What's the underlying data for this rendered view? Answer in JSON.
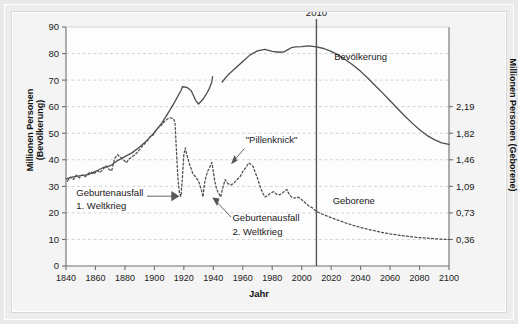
{
  "figure": {
    "xlabel": "Jahr",
    "ylabel_left": "Millionen Personen (Bevölkerung)",
    "ylabel_right": "Millionen Personen (Geborene)"
  },
  "annotations": {
    "marker_year": "2010",
    "series_population": "Bevölkerung",
    "series_births": "Geborene",
    "pillenknick": "\"Pillenknick\"",
    "wk1_line1": "Geburtenausfall",
    "wk1_line2": "1. Weltkrieg",
    "wk2_line1": "Geburtenausfall",
    "wk2_line2": "2. Weltkrieg"
  },
  "chart_data": {
    "type": "line",
    "title": "",
    "xlabel": "Jahr",
    "ylabel": "Millionen Personen (Bevölkerung)",
    "ylabel_secondary": "Millionen Personen (Geborene)",
    "xlim": [
      1840,
      2100
    ],
    "ylim": [
      0,
      90
    ],
    "ylim_secondary": [
      0,
      3.28
    ],
    "xticks": [
      1840,
      1860,
      1880,
      1900,
      1920,
      1940,
      1960,
      1980,
      2000,
      2020,
      2040,
      2060,
      2080,
      2100
    ],
    "yticks_left": [
      0,
      10,
      20,
      30,
      40,
      50,
      60,
      70,
      80,
      90
    ],
    "yticks_right_labels": [
      "0,36",
      "0,73",
      "1,09",
      "1,46",
      "1,82",
      "2,19"
    ],
    "yticks_right_at_left_values": [
      10,
      20,
      30,
      40,
      50,
      60
    ],
    "grid": true,
    "grid_style": "dashed-horizontal",
    "legend": "inline-labels",
    "vertical_marker": 2010,
    "series": [
      {
        "name": "Bevölkerung",
        "style": "solid",
        "axis": "left",
        "unit": "Millionen Personen",
        "points": [
          [
            1840,
            32.8
          ],
          [
            1845,
            33.6
          ],
          [
            1850,
            34.0
          ],
          [
            1855,
            34.4
          ],
          [
            1860,
            35.6
          ],
          [
            1865,
            37.0
          ],
          [
            1867,
            37.2
          ],
          [
            1870,
            37.8
          ],
          [
            1871,
            38.0
          ],
          [
            1875,
            39.7
          ],
          [
            1880,
            41.2
          ],
          [
            1885,
            42.7
          ],
          [
            1890,
            44.8
          ],
          [
            1895,
            47.3
          ],
          [
            1900,
            50.3
          ],
          [
            1905,
            53.8
          ],
          [
            1910,
            58.2
          ],
          [
            1914,
            62.0
          ],
          [
            1918,
            66.0
          ],
          [
            1919,
            67.5
          ],
          [
            1922,
            67.3
          ],
          [
            1925,
            66.0
          ],
          [
            1928,
            62.4
          ],
          [
            1930,
            61.0
          ],
          [
            1933,
            62.8
          ],
          [
            1935,
            64.5
          ],
          [
            1937,
            66.5
          ],
          [
            1939,
            69.3
          ],
          [
            1939.5,
            71.3
          ],
          [
            1946,
            69.3
          ],
          [
            1950,
            72.0
          ],
          [
            1955,
            74.5
          ],
          [
            1960,
            77.0
          ],
          [
            1965,
            79.5
          ],
          [
            1970,
            81.0
          ],
          [
            1975,
            81.6
          ],
          [
            1980,
            80.8
          ],
          [
            1985,
            80.5
          ],
          [
            1988,
            80.6
          ],
          [
            1990,
            81.3
          ],
          [
            1993,
            82.2
          ],
          [
            1996,
            82.5
          ],
          [
            2000,
            82.6
          ],
          [
            2005,
            82.9
          ],
          [
            2010,
            82.5
          ],
          [
            2015,
            81.9
          ],
          [
            2020,
            80.8
          ],
          [
            2025,
            79.4
          ],
          [
            2030,
            77.6
          ],
          [
            2035,
            75.6
          ],
          [
            2040,
            73.3
          ],
          [
            2045,
            70.7
          ],
          [
            2050,
            67.9
          ],
          [
            2055,
            65.1
          ],
          [
            2060,
            62.2
          ],
          [
            2065,
            59.3
          ],
          [
            2070,
            56.5
          ],
          [
            2075,
            53.8
          ],
          [
            2080,
            51.3
          ],
          [
            2085,
            49.2
          ],
          [
            2090,
            47.6
          ],
          [
            2095,
            46.4
          ],
          [
            2100,
            45.8
          ]
        ]
      },
      {
        "name": "Geborene",
        "style": "dotted",
        "axis": "right",
        "unit": "Millionen Geborene",
        "points_in_left_scale": [
          [
            1841,
            32.0
          ],
          [
            1843,
            33.5
          ],
          [
            1845,
            32.6
          ],
          [
            1847,
            34.2
          ],
          [
            1849,
            33.2
          ],
          [
            1851,
            34.3
          ],
          [
            1853,
            33.6
          ],
          [
            1855,
            34.8
          ],
          [
            1857,
            35.4
          ],
          [
            1859,
            34.6
          ],
          [
            1861,
            36.0
          ],
          [
            1863,
            35.2
          ],
          [
            1865,
            36.3
          ],
          [
            1867,
            37.8
          ],
          [
            1869,
            36.5
          ],
          [
            1871,
            35.8
          ],
          [
            1873,
            40.5
          ],
          [
            1875,
            41.9
          ],
          [
            1877,
            41.0
          ],
          [
            1879,
            40.0
          ],
          [
            1881,
            38.9
          ],
          [
            1883,
            40.4
          ],
          [
            1885,
            41.2
          ],
          [
            1887,
            42.0
          ],
          [
            1889,
            43.1
          ],
          [
            1891,
            44.6
          ],
          [
            1893,
            45.8
          ],
          [
            1895,
            47.0
          ],
          [
            1897,
            48.6
          ],
          [
            1899,
            49.2
          ],
          [
            1901,
            51.0
          ],
          [
            1903,
            52.3
          ],
          [
            1905,
            53.2
          ],
          [
            1907,
            54.5
          ],
          [
            1909,
            55.4
          ],
          [
            1911,
            55.8
          ],
          [
            1913,
            55.5
          ],
          [
            1914,
            54.0
          ],
          [
            1915,
            43.0
          ],
          [
            1916,
            33.0
          ],
          [
            1917,
            27.5
          ],
          [
            1918,
            26.2
          ],
          [
            1919,
            33.0
          ],
          [
            1920,
            42.0
          ],
          [
            1921,
            44.5
          ],
          [
            1922,
            42.0
          ],
          [
            1924,
            38.0
          ],
          [
            1926,
            35.0
          ],
          [
            1928,
            33.5
          ],
          [
            1930,
            32.0
          ],
          [
            1932,
            28.5
          ],
          [
            1933,
            26.0
          ],
          [
            1934,
            31.0
          ],
          [
            1935,
            33.5
          ],
          [
            1936,
            35.5
          ],
          [
            1937,
            36.5
          ],
          [
            1939,
            39.0
          ],
          [
            1940,
            35.5
          ],
          [
            1941,
            32.0
          ],
          [
            1942,
            29.5
          ],
          [
            1943,
            28.0
          ],
          [
            1944,
            27.0
          ],
          [
            1945,
            26.0
          ],
          [
            1946,
            28.5
          ],
          [
            1948,
            32.5
          ],
          [
            1950,
            31.0
          ],
          [
            1952,
            30.5
          ],
          [
            1954,
            31.2
          ],
          [
            1956,
            32.5
          ],
          [
            1958,
            33.5
          ],
          [
            1960,
            35.5
          ],
          [
            1962,
            37.0
          ],
          [
            1964,
            38.8
          ],
          [
            1965,
            38.5
          ],
          [
            1966,
            38.0
          ],
          [
            1967,
            37.5
          ],
          [
            1968,
            36.0
          ],
          [
            1970,
            33.0
          ],
          [
            1972,
            29.5
          ],
          [
            1974,
            27.0
          ],
          [
            1975,
            26.0
          ],
          [
            1977,
            26.5
          ],
          [
            1979,
            27.5
          ],
          [
            1981,
            28.0
          ],
          [
            1983,
            27.0
          ],
          [
            1985,
            26.8
          ],
          [
            1987,
            27.5
          ],
          [
            1989,
            28.5
          ],
          [
            1990,
            28.8
          ],
          [
            1991,
            27.5
          ],
          [
            1993,
            26.0
          ],
          [
            1995,
            25.5
          ],
          [
            1997,
            26.0
          ],
          [
            1999,
            25.5
          ],
          [
            2001,
            24.5
          ],
          [
            2003,
            23.5
          ],
          [
            2005,
            22.5
          ],
          [
            2007,
            22.0
          ],
          [
            2009,
            21.0
          ],
          [
            2011,
            20.3
          ],
          [
            2015,
            19.3
          ],
          [
            2020,
            18.2
          ],
          [
            2025,
            17.2
          ],
          [
            2030,
            16.2
          ],
          [
            2035,
            15.3
          ],
          [
            2040,
            14.5
          ],
          [
            2045,
            13.8
          ],
          [
            2050,
            13.2
          ],
          [
            2055,
            12.6
          ],
          [
            2060,
            12.1
          ],
          [
            2065,
            11.7
          ],
          [
            2070,
            11.3
          ],
          [
            2075,
            11.0
          ],
          [
            2080,
            10.7
          ],
          [
            2085,
            10.5
          ],
          [
            2090,
            10.3
          ],
          [
            2095,
            10.1
          ],
          [
            2100,
            10.0
          ]
        ]
      }
    ],
    "annotations": [
      {
        "text": "2010",
        "type": "vertical-marker-label",
        "x": 2010
      },
      {
        "text": "Bevölkerung",
        "type": "series-label",
        "x": 2032,
        "y": 77
      },
      {
        "text": "Geborene",
        "type": "series-label",
        "x": 2012,
        "y": 24
      },
      {
        "text": "\"Pillenknick\"",
        "type": "callout",
        "x": 1975,
        "y": 42
      },
      {
        "text": "Geburtenausfall 1. Weltkrieg",
        "type": "callout",
        "x": 1880,
        "y": 28
      },
      {
        "text": "Geburtenausfall 2. Weltkrieg",
        "type": "callout",
        "x": 1955,
        "y": 19
      }
    ]
  },
  "colors": {
    "line": "#4d4d4d",
    "grid": "#c9c9c9",
    "axis": "#6f6f6f",
    "text": "#1a1a1a",
    "card_bg": "#f4f4f4",
    "page_bg": "#e9e9e9"
  }
}
